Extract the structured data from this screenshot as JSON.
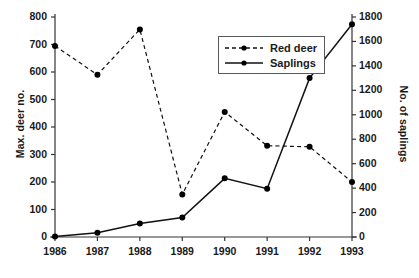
{
  "chart_data": {
    "type": "line",
    "title": "",
    "xlabel": "",
    "ylabel": "Max. deer no.",
    "ylabel_right": "No. of saplings",
    "categories": [
      "1986",
      "1987",
      "1988",
      "1989",
      "1990",
      "1991",
      "1992",
      "1993"
    ],
    "x": [
      1986,
      1987,
      1988,
      1989,
      1990,
      1991,
      1992,
      1993
    ],
    "ylim": [
      0,
      800
    ],
    "ylim_right": [
      0,
      1800
    ],
    "yticks": [
      0,
      100,
      200,
      300,
      400,
      500,
      600,
      700,
      800
    ],
    "yticks_right": [
      0,
      200,
      400,
      600,
      800,
      1000,
      1200,
      1400,
      1600,
      1800
    ],
    "grid": false,
    "legend_position": "top-center-right",
    "series": [
      {
        "name": "Red deer",
        "axis": "left",
        "style": "dashed",
        "marker": "filled-circle",
        "values": [
          695,
          590,
          755,
          155,
          455,
          332,
          328,
          200
        ]
      },
      {
        "name": "Saplings",
        "axis": "right",
        "style": "solid",
        "marker": "filled-circle",
        "values": [
          5,
          35,
          110,
          160,
          480,
          395,
          1300,
          1740
        ]
      }
    ]
  },
  "legend": {
    "items": [
      {
        "label": "Red deer",
        "style": "dashed"
      },
      {
        "label": "Saplings",
        "style": "solid"
      }
    ]
  },
  "axes": {
    "left_title": "Max. deer no.",
    "right_title": "No. of saplings",
    "left_ticks": [
      "800",
      "700",
      "600",
      "500",
      "400",
      "300",
      "200",
      "100",
      "0"
    ],
    "right_ticks": [
      "1800",
      "1600",
      "1400",
      "1200",
      "1000",
      "800",
      "600",
      "400",
      "200",
      "0"
    ],
    "x_ticks": [
      "1986",
      "1987",
      "1988",
      "1989",
      "1990",
      "1991",
      "1992",
      "1993"
    ]
  },
  "caption": {
    "text": ""
  },
  "colors": {
    "line": "#111111",
    "axis": "#333333",
    "marker": "#000000",
    "background": "#ffffff"
  }
}
